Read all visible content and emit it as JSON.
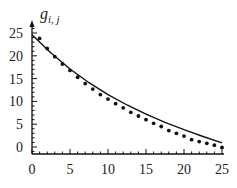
{
  "chart_data": {
    "type": "line",
    "title": "",
    "xlabel": "",
    "ylabel": "g_{i,j}",
    "ylabel_main": "g",
    "ylabel_sub": "i, j",
    "xlim": [
      0,
      25
    ],
    "ylim": [
      -1.5,
      27
    ],
    "xticks": [
      0,
      5,
      10,
      15,
      20,
      25
    ],
    "yticks": [
      0,
      5,
      10,
      15,
      20,
      25
    ],
    "grid": false,
    "legend": null,
    "series": [
      {
        "name": "fitted curve",
        "style": "line",
        "x": [
          0,
          2.5,
          5,
          7.5,
          10,
          12.5,
          15,
          17.5,
          20,
          22.5,
          25
        ],
        "values": [
          24.6,
          20.6,
          17.1,
          14.1,
          11.5,
          9.2,
          7.2,
          5.4,
          3.8,
          2.3,
          0.9
        ]
      },
      {
        "name": "data points",
        "style": "markers",
        "x": [
          1,
          2,
          3,
          4,
          5,
          6,
          7,
          8,
          9,
          10,
          11,
          12,
          13,
          14,
          15,
          16,
          17,
          18,
          19,
          20,
          21,
          22,
          23,
          24,
          25
        ],
        "values": [
          23.8,
          21.6,
          19.8,
          18.2,
          16.8,
          15.3,
          13.9,
          12.7,
          11.5,
          10.5,
          9.5,
          8.6,
          7.6,
          6.8,
          6.0,
          5.2,
          4.5,
          3.6,
          3.0,
          2.4,
          1.6,
          1.2,
          0.8,
          0.4,
          -0.1
        ]
      }
    ]
  }
}
